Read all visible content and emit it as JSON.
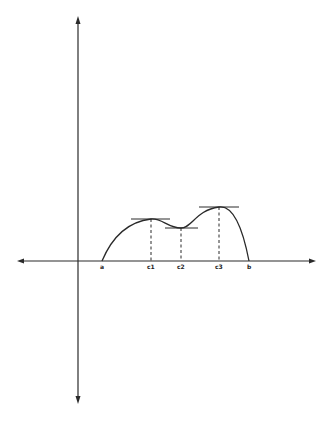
{
  "diagram": {
    "type": "function-graph-critical-points",
    "colors": {
      "stroke": "#2a2a2a",
      "background": "#ffffff"
    },
    "labels": {
      "a": "a",
      "c1": "c1",
      "c2": "c2",
      "c3": "c3",
      "b": "b"
    },
    "points": [
      {
        "name": "a",
        "label": "a",
        "kind": "endpoint"
      },
      {
        "name": "c1",
        "label": "c1",
        "kind": "local maximum",
        "tangent": "horizontal"
      },
      {
        "name": "c2",
        "label": "c2",
        "kind": "local minimum",
        "tangent": "horizontal"
      },
      {
        "name": "c3",
        "label": "c3",
        "kind": "absolute maximum",
        "tangent": "horizontal"
      },
      {
        "name": "b",
        "label": "b",
        "kind": "endpoint"
      }
    ]
  }
}
